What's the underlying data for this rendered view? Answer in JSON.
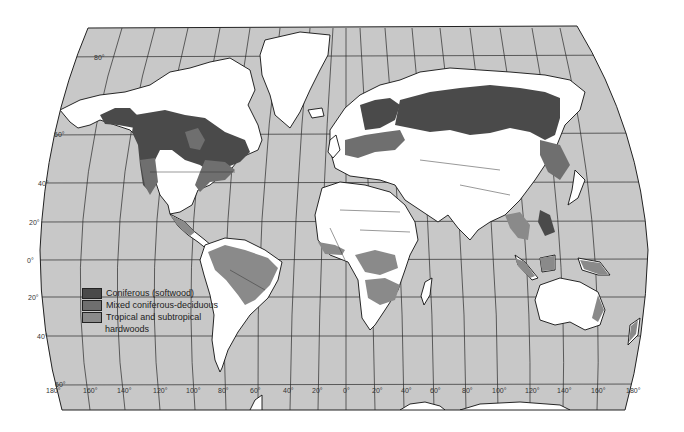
{
  "map": {
    "title": "World forest distribution",
    "colors": {
      "ocean": "#c8c8c8",
      "land": "#ffffff",
      "coniferous": "#4a4a4a",
      "mixed": "#6f6f6f",
      "tropical": "#8a8a8a"
    },
    "latitude_labels": [
      {
        "label": "80°",
        "x": 94,
        "y": 60
      },
      {
        "label": "60°",
        "x": 54,
        "y": 136
      },
      {
        "label": "40°",
        "x": 38,
        "y": 184
      },
      {
        "label": "20°",
        "x": 29,
        "y": 224
      },
      {
        "label": "0°",
        "x": 27,
        "y": 262
      },
      {
        "label": "20°",
        "x": 28,
        "y": 299
      },
      {
        "label": "40°",
        "x": 37,
        "y": 338
      },
      {
        "label": "60°",
        "x": 55,
        "y": 386
      }
    ],
    "longitude_labels": [
      {
        "label": "180°",
        "x": 46
      },
      {
        "label": "160°",
        "x": 83
      },
      {
        "label": "140°",
        "x": 117
      },
      {
        "label": "120°",
        "x": 153
      },
      {
        "label": "100°",
        "x": 186
      },
      {
        "label": "80°",
        "x": 218
      },
      {
        "label": "60°",
        "x": 250
      },
      {
        "label": "40°",
        "x": 283
      },
      {
        "label": "20°",
        "x": 312
      },
      {
        "label": "0°",
        "x": 343
      },
      {
        "label": "20°",
        "x": 372
      },
      {
        "label": "40°",
        "x": 401
      },
      {
        "label": "60°",
        "x": 430
      },
      {
        "label": "80°",
        "x": 462
      },
      {
        "label": "100°",
        "x": 492
      },
      {
        "label": "120°",
        "x": 525
      },
      {
        "label": "140°",
        "x": 557
      },
      {
        "label": "160°",
        "x": 591
      },
      {
        "label": "180°",
        "x": 626
      }
    ]
  },
  "legend": {
    "items": [
      {
        "label": "Coniferous (softwood)",
        "color": "#4a4a4a"
      },
      {
        "label": "Mixed coniferous-deciduous",
        "color": "#6f6f6f"
      },
      {
        "label": "Tropical and subtropical",
        "color": "#8a8a8a",
        "continuation": "hardwoods"
      }
    ]
  }
}
